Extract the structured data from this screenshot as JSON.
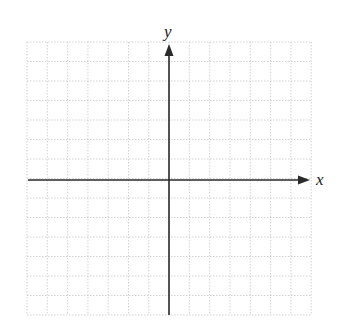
{
  "diagram": {
    "type": "coordinate-plane",
    "axes": {
      "x_label": "x",
      "y_label": "y",
      "x_arrow": "positive-direction",
      "y_arrow": "positive-direction"
    },
    "grid": {
      "columns": 14,
      "rows": 14,
      "cells_left_of_y_axis": 7,
      "cells_right_of_y_axis": 7,
      "cells_above_x_axis": 7,
      "cells_below_x_axis": 7,
      "line_style": "dotted"
    },
    "colors": {
      "grid": "#c8c8c8",
      "axes": "#2a2a2a",
      "background": "#ffffff"
    },
    "geometry": {
      "grid_left": 27,
      "grid_top": 42,
      "cell_w": 20.3,
      "cell_h": 19.5,
      "origin_x": 169,
      "origin_y": 180,
      "x_axis_start": 28,
      "x_axis_end": 310,
      "y_axis_start": 315,
      "y_axis_end": 44
    }
  }
}
